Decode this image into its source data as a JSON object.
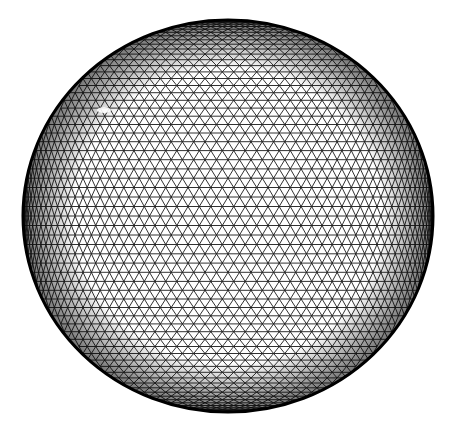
{
  "figure": {
    "background": "#ffffff",
    "line_color": "#1a1a1a",
    "outline_color": "#000000",
    "sphere": {
      "cx": 228,
      "cy": 216,
      "rx": 205,
      "ry": 196
    },
    "mesh": {
      "density": 56
    },
    "highlight": {
      "x": 104,
      "y": 110,
      "color": "#ffffff"
    }
  }
}
